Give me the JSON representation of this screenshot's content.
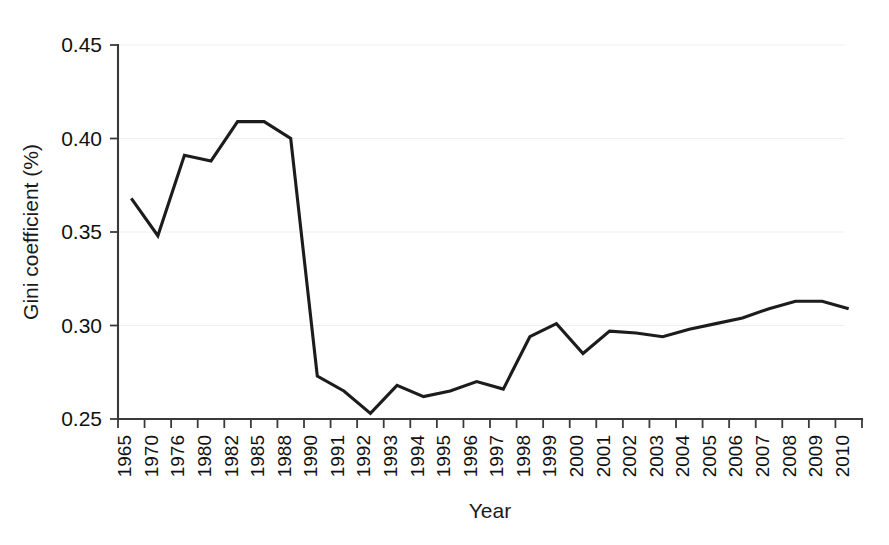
{
  "chart_data": {
    "type": "line",
    "title": "",
    "subtitle": "",
    "xlabel": "Year",
    "ylabel": "Gini coefficient (%)",
    "categories": [
      "1965",
      "1970",
      "1976",
      "1980",
      "1982",
      "1985",
      "1988",
      "1990",
      "1991",
      "1992",
      "1993",
      "1994",
      "1995",
      "1996",
      "1997",
      "1998",
      "1999",
      "2000",
      "2001",
      "2002",
      "2003",
      "2004",
      "2005",
      "2006",
      "2007",
      "2008",
      "2009",
      "2010"
    ],
    "values": [
      0.368,
      0.348,
      0.391,
      0.388,
      0.409,
      0.409,
      0.4,
      0.273,
      0.265,
      0.253,
      0.268,
      0.262,
      0.265,
      0.27,
      0.266,
      0.294,
      0.301,
      0.285,
      0.297,
      0.296,
      0.294,
      0.298,
      0.301,
      0.304,
      0.309,
      0.313,
      0.313,
      0.309
    ],
    "series": [
      {
        "name": "Gini coefficient",
        "values": [
          0.368,
          0.348,
          0.391,
          0.388,
          0.409,
          0.409,
          0.4,
          0.273,
          0.265,
          0.253,
          0.268,
          0.262,
          0.265,
          0.27,
          0.266,
          0.294,
          0.301,
          0.285,
          0.297,
          0.296,
          0.294,
          0.298,
          0.301,
          0.304,
          0.309,
          0.313,
          0.313,
          0.309
        ],
        "color": "#1c1c1c"
      }
    ],
    "ylim": [
      0.25,
      0.45
    ],
    "yticks": [
      0.25,
      0.3,
      0.35,
      0.4,
      0.45
    ],
    "ytick_labels": [
      "0.25",
      "0.30",
      "0.35",
      "0.40",
      "0.45"
    ],
    "grid": true,
    "grid_axis": "y",
    "legend": false,
    "legend_position": "none",
    "annotations": [],
    "colors": {
      "line": "#1c1c1c",
      "grid": "#efefef",
      "axis": "#3a3a3a",
      "background": "#ffffff",
      "text": "#111111"
    }
  }
}
